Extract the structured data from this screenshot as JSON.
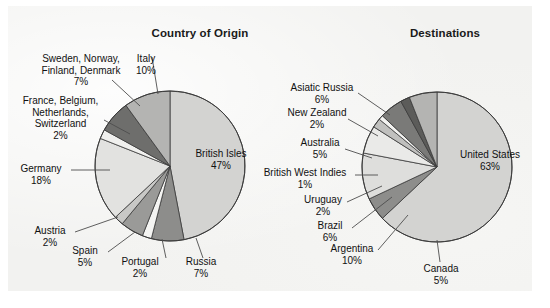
{
  "figure": {
    "background_color": "#f2f2f0",
    "width": 550,
    "height": 308
  },
  "charts": {
    "origin": {
      "title": "Country of Origin",
      "center": [
        170,
        166
      ],
      "radius": 75
    },
    "destinations": {
      "title": "Destinations",
      "center": [
        437,
        167
      ],
      "radius": 75
    }
  },
  "labels": {
    "origin": {
      "italy": {
        "name": "Italy",
        "pct": "10%"
      },
      "scandinavia": {
        "name": "Sweden, Norway,\nFinland, Denmark",
        "line1": "Sweden, Norway,",
        "line2": "Finland, Denmark",
        "pct": "7%"
      },
      "france": {
        "line1": "France, Belgium,",
        "line2": "Netherlands,",
        "line3": "Switzerland",
        "pct": "2%"
      },
      "germany": {
        "name": "Germany",
        "pct": "18%"
      },
      "austria": {
        "name": "Austria",
        "pct": "2%"
      },
      "spain": {
        "name": "Spain",
        "pct": "5%"
      },
      "portugal": {
        "name": "Portugal",
        "pct": "2%"
      },
      "russia": {
        "name": "Russia",
        "pct": "7%"
      },
      "british_isles": {
        "name": "British Isles",
        "pct": "47%"
      }
    },
    "destinations": {
      "asiatic_russia": {
        "name": "Asiatic Russia",
        "pct": "6%"
      },
      "new_zealand": {
        "name": "New Zealand",
        "pct": "2%"
      },
      "australia": {
        "name": "Australia",
        "pct": "5%"
      },
      "bwi": {
        "name": "British West Indies",
        "pct": "1%"
      },
      "uruguay": {
        "name": "Uruguay",
        "pct": "2%"
      },
      "brazil": {
        "name": "Brazil",
        "pct": "6%"
      },
      "argentina": {
        "name": "Argentina",
        "pct": "10%"
      },
      "canada": {
        "name": "Canada",
        "pct": "5%"
      },
      "united_states": {
        "name": "United States",
        "pct": "63%"
      }
    }
  },
  "chart_data": [
    {
      "type": "pie",
      "title": "Country of Origin",
      "start_angle_deg": 0,
      "direction": "clockwise",
      "units": "percent",
      "labels": [
        "British Isles",
        "Russia",
        "Portugal",
        "Spain",
        "Austria",
        "Germany",
        "France, Belgium, Netherlands, Switzerland",
        "Sweden, Norway, Finland, Denmark",
        "Italy"
      ],
      "values": [
        47,
        7,
        2,
        5,
        2,
        18,
        2,
        7,
        10
      ],
      "colors": [
        "#d3d3d1",
        "#8d8d8b",
        "#f4f4f2",
        "#9a9a98",
        "#c8c8c6",
        "#e2e2e0",
        "#f0f0ee",
        "#6e6e6c",
        "#b4b4b2"
      ],
      "legend": "none"
    },
    {
      "type": "pie",
      "title": "Destinations",
      "start_angle_deg": 0,
      "direction": "clockwise",
      "units": "percent",
      "labels": [
        "United States",
        "Canada",
        "Argentina",
        "Brazil",
        "Uruguay",
        "British West Indies",
        "Australia",
        "New Zealand",
        "Asiatic Russia"
      ],
      "values": [
        63,
        5,
        10,
        6,
        2,
        1,
        5,
        2,
        6
      ],
      "colors": [
        "#d3d3d1",
        "#8d8d8b",
        "#dededc",
        "#eaeae8",
        "#c0c0be",
        "#f2f2f0",
        "#7a7a78",
        "#5c5c5a",
        "#b4b4b2"
      ],
      "legend": "none"
    }
  ]
}
